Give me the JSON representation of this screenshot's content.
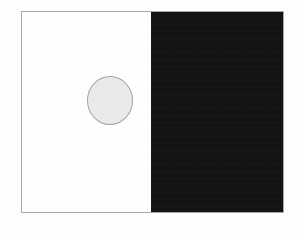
{
  "figure": {
    "type": "simultaneous-contrast-illusion",
    "frame": {
      "border_color": "#a9a9a9",
      "border_width_px": 1,
      "x": 21,
      "y": 11,
      "width": 263,
      "height": 202
    },
    "panels": [
      {
        "id": "left-panel",
        "name": "light-background-panel",
        "background_color": "#ffffff",
        "label": "",
        "width_px": 129
      },
      {
        "id": "right-panel",
        "name": "dark-background-panel",
        "background_color": "#100f0f",
        "label": "",
        "width_px": 132
      }
    ],
    "discs": [
      {
        "id": "disc-left",
        "name": "gray-disc-on-light",
        "fill_color": "#eeedeb",
        "outline_color": "#a3a3a3",
        "center_x": 109,
        "center_y": 99,
        "diameter_px": 47,
        "label": ""
      },
      {
        "id": "disc-right",
        "name": "gray-disc-on-dark",
        "fill_color": "#e9e7e3",
        "outline_color": "none",
        "center_x": 195,
        "center_y": 96,
        "diameter_px": 42,
        "label": ""
      }
    ]
  },
  "page": {
    "background_color": "#fefefe",
    "width": 298,
    "height": 233,
    "caption": ""
  }
}
